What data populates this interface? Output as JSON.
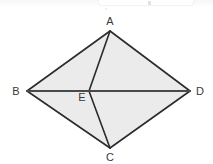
{
  "figure": {
    "name": "quadrilateral-abcd-with-diagonals",
    "background_color": "#ffffff",
    "fill_color": "#ebebeb",
    "stroke_color": "#2b2b2b",
    "label_color": "#3a3a3a",
    "points": {
      "A": {
        "label": "A",
        "x": 110,
        "y": 31,
        "label_x": 110,
        "label_y": 25
      },
      "B": {
        "label": "B",
        "x": 27,
        "y": 91,
        "label_x": 16,
        "label_y": 95
      },
      "C": {
        "label": "C",
        "x": 110,
        "y": 148,
        "label_x": 110,
        "label_y": 161
      },
      "D": {
        "label": "D",
        "x": 190,
        "y": 91,
        "label_x": 200,
        "label_y": 95
      },
      "E": {
        "label": "E",
        "x": 89,
        "y": 91,
        "label_x": 82,
        "label_y": 101
      }
    },
    "outline_path": "M110,31 L190,91 L110,148 L27,91 Z",
    "segments": [
      {
        "name": "AB",
        "from": "A",
        "to": "B",
        "width": 1.6
      },
      {
        "name": "AD",
        "from": "A",
        "to": "D",
        "width": 1.6
      },
      {
        "name": "BC",
        "from": "B",
        "to": "C",
        "width": 1.6
      },
      {
        "name": "CD",
        "from": "C",
        "to": "D",
        "width": 1.6
      },
      {
        "name": "BD",
        "from": "B",
        "to": "D",
        "width": 2.0
      },
      {
        "name": "AE",
        "from": "A",
        "to": "E",
        "width": 1.6
      },
      {
        "name": "EC",
        "from": "E",
        "to": "C",
        "width": 1.6
      }
    ]
  }
}
